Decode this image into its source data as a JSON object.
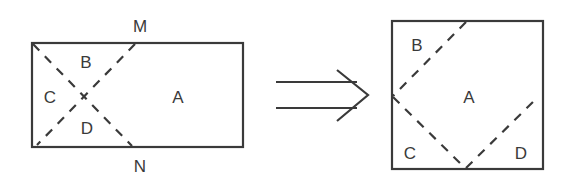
{
  "figure": {
    "colors": {
      "stroke": "#3a3a3a",
      "background": "#ffffff"
    },
    "before": {
      "shape": "rectangle",
      "regions": {
        "A": "A",
        "B": "B",
        "C": "C",
        "D": "D"
      },
      "points": {
        "M": "M",
        "N": "N"
      }
    },
    "arrow": {
      "type": "double-line-implies-arrow",
      "meaning": "transforms into"
    },
    "after": {
      "shape": "square",
      "regions": {
        "A": "A",
        "B": "B",
        "C": "C",
        "D": "D"
      }
    }
  }
}
